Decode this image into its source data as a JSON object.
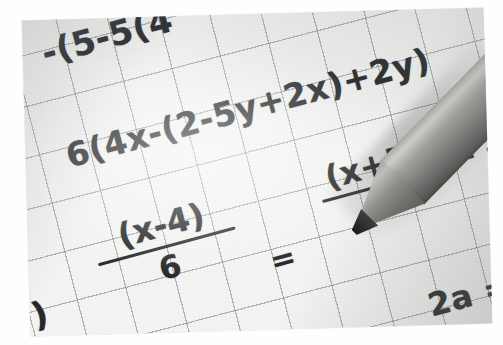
{
  "scene": {
    "subject": "handwritten-algebra-on-graph-paper",
    "medium": "black-and-white-photograph",
    "border_color": "#ffffff",
    "paper_color": "#f3f3f2",
    "grid_color": "#787e84",
    "ink_color": "#26282b"
  },
  "pencil": {
    "name": "pencil",
    "body_color": "#8c8b88",
    "lead_color": "#1a1a1a",
    "orientation": "tip pointing down-left from upper-right"
  },
  "handwriting": {
    "line1": "-(5-5(4",
    "line2": "6(4x-(2-5y+2x)+2y)",
    "fraction_left": {
      "numerator": "(x-4)",
      "denominator": "6"
    },
    "equals_middle": "=",
    "fraction_right": {
      "numerator": "(x+5)",
      "denominator": "5"
    },
    "equals_right": "= -",
    "tail_bottom_left": ")",
    "tail_bottom_right": "2a ="
  }
}
